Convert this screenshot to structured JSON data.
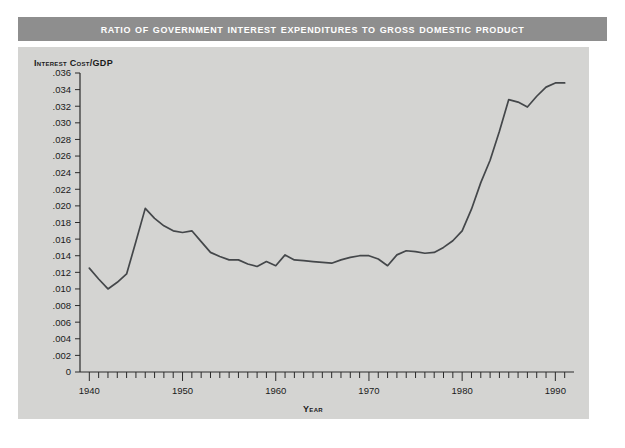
{
  "figure": {
    "title": "Ratio of Government Interest Expenditures to Gross Domestic Product",
    "panel_color": "#d4d4d2",
    "title_bar_color": "#8e8e8e",
    "line_color": "#44474a",
    "background_color": "#ffffff"
  },
  "axes": {
    "y_axis_title": "Interest Cost/GDP",
    "x_axis_title": "Year",
    "y_ticklabels": [
      ".036",
      ".034",
      ".032",
      ".030",
      ".028",
      ".026",
      ".024",
      ".022",
      ".020",
      ".018",
      ".016",
      ".014",
      ".012",
      ".010",
      ".008",
      ".006",
      ".004",
      ".002",
      "0"
    ],
    "x_ticklabels": [
      "1940",
      "1950",
      "1960",
      "1970",
      "1980",
      "1990"
    ]
  },
  "chart_data": {
    "type": "line",
    "title": "Ratio of Government Interest Expenditures to Gross Domestic Product",
    "xlabel": "Year",
    "ylabel": "Interest Cost/GDP",
    "xlim": [
      1939,
      1992
    ],
    "ylim": [
      0,
      0.036
    ],
    "grid": false,
    "legend": "none",
    "y_tick_step": 0.002,
    "x_tick_step": 1,
    "x_labeled_ticks": [
      1940,
      1950,
      1960,
      1970,
      1980,
      1990
    ],
    "series": [
      {
        "name": "Interest Cost/GDP",
        "x": [
          1940,
          1941,
          1942,
          1943,
          1944,
          1945,
          1946,
          1947,
          1948,
          1949,
          1950,
          1951,
          1952,
          1953,
          1954,
          1955,
          1956,
          1957,
          1958,
          1959,
          1960,
          1961,
          1962,
          1963,
          1964,
          1965,
          1966,
          1967,
          1968,
          1969,
          1970,
          1971,
          1972,
          1973,
          1974,
          1975,
          1976,
          1977,
          1978,
          1979,
          1980,
          1981,
          1982,
          1983,
          1984,
          1985,
          1986,
          1987,
          1988,
          1989,
          1990,
          1991
        ],
        "values": [
          0.0125,
          0.0112,
          0.01,
          0.0108,
          0.0118,
          0.0157,
          0.0197,
          0.0185,
          0.0176,
          0.017,
          0.0168,
          0.017,
          0.0157,
          0.0144,
          0.0139,
          0.0135,
          0.0135,
          0.013,
          0.0127,
          0.0133,
          0.0128,
          0.0141,
          0.0135,
          0.0134,
          0.0133,
          0.0132,
          0.0131,
          0.0135,
          0.0138,
          0.014,
          0.014,
          0.0136,
          0.0128,
          0.0141,
          0.0146,
          0.0145,
          0.0143,
          0.0144,
          0.015,
          0.0158,
          0.017,
          0.0196,
          0.0228,
          0.0255,
          0.029,
          0.0328,
          0.0325,
          0.0319,
          0.0332,
          0.0343,
          0.0348,
          0.0348
        ]
      }
    ]
  }
}
